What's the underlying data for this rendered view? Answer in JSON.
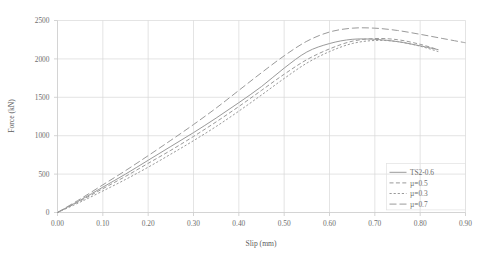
{
  "chart_data": {
    "type": "line",
    "title": "",
    "xlabel": "Slip (mm)",
    "ylabel": "Force (kN)",
    "xlim": [
      0.0,
      0.9
    ],
    "ylim": [
      0,
      2500
    ],
    "xticks": [
      "0.00",
      "0.10",
      "0.20",
      "0.30",
      "0.40",
      "0.50",
      "0.60",
      "0.70",
      "0.80",
      "0.90"
    ],
    "yticks": [
      "0",
      "500",
      "1000",
      "1500",
      "2000",
      "2500"
    ],
    "grid": true,
    "legend_position": "lower-right",
    "series": [
      {
        "name": "TS2-0.6",
        "style": "solid",
        "color": "#9a9a9a",
        "x": [
          0.0,
          0.05,
          0.1,
          0.15,
          0.2,
          0.25,
          0.3,
          0.35,
          0.4,
          0.45,
          0.5,
          0.55,
          0.6,
          0.65,
          0.7,
          0.75,
          0.8,
          0.84
        ],
        "y": [
          0,
          160,
          330,
          500,
          680,
          860,
          1040,
          1230,
          1430,
          1640,
          1880,
          2090,
          2200,
          2255,
          2255,
          2225,
          2170,
          2120
        ]
      },
      {
        "name": "µ=0.5",
        "style": "dashed",
        "color": "#9a9a9a",
        "x": [
          0.0,
          0.05,
          0.1,
          0.15,
          0.2,
          0.25,
          0.3,
          0.35,
          0.4,
          0.45,
          0.5,
          0.55,
          0.6,
          0.65,
          0.7,
          0.75,
          0.8,
          0.84
        ],
        "y": [
          0,
          150,
          310,
          470,
          640,
          810,
          990,
          1180,
          1380,
          1590,
          1800,
          1990,
          2130,
          2230,
          2265,
          2250,
          2190,
          2120
        ]
      },
      {
        "name": "µ=0.3",
        "style": "dotted",
        "color": "#9a9a9a",
        "x": [
          0.0,
          0.05,
          0.1,
          0.15,
          0.2,
          0.25,
          0.3,
          0.35,
          0.4,
          0.45,
          0.5,
          0.55,
          0.6,
          0.65,
          0.7,
          0.75,
          0.8,
          0.84
        ],
        "y": [
          0,
          135,
          280,
          430,
          590,
          760,
          935,
          1120,
          1320,
          1530,
          1745,
          1945,
          2095,
          2200,
          2240,
          2225,
          2165,
          2095
        ]
      },
      {
        "name": "µ=0.7",
        "style": "longdash",
        "color": "#9a9a9a",
        "x": [
          0.0,
          0.05,
          0.1,
          0.15,
          0.2,
          0.25,
          0.3,
          0.35,
          0.4,
          0.45,
          0.5,
          0.55,
          0.6,
          0.65,
          0.7,
          0.75,
          0.8,
          0.85,
          0.9
        ],
        "y": [
          0,
          175,
          360,
          545,
          740,
          940,
          1145,
          1360,
          1590,
          1820,
          2040,
          2230,
          2350,
          2400,
          2400,
          2370,
          2320,
          2265,
          2210
        ]
      }
    ]
  },
  "legend": {
    "items": [
      {
        "label": "TS2-0.6",
        "style": "solid"
      },
      {
        "label": "µ=0.5",
        "style": "dashed"
      },
      {
        "label": "µ=0.3",
        "style": "dotted"
      },
      {
        "label": "µ=0.7",
        "style": "longdash"
      }
    ]
  }
}
